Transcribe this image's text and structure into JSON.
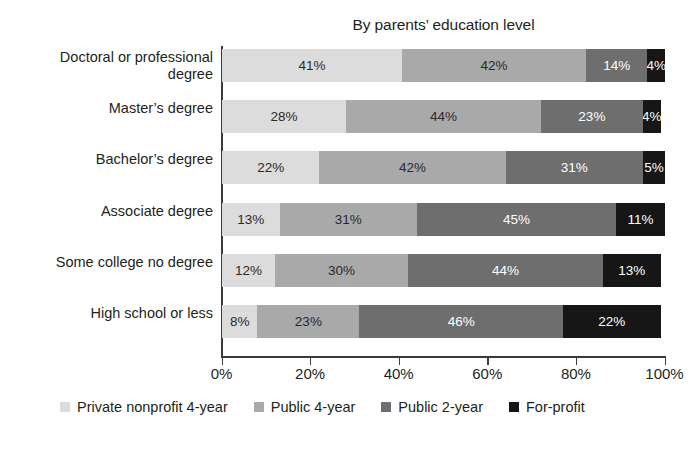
{
  "chart_data": {
    "type": "bar",
    "subtype": "stacked-horizontal-100pct",
    "title": "By parents’ education level",
    "xlabel": "",
    "ylabel": "",
    "xlim": [
      0,
      100
    ],
    "grid": false,
    "legend_position": "bottom",
    "categories": [
      "Doctoral or professional\ndegree",
      "Master’s degree",
      "Bachelor’s degree",
      "Associate degree",
      "Some college no degree",
      "High school or less"
    ],
    "series": [
      {
        "name": "Private nonprofit 4-year",
        "color": "#dcdcdc",
        "values": [
          41,
          28,
          22,
          13,
          12,
          8
        ]
      },
      {
        "name": "Public 4-year",
        "color": "#a9a9a9",
        "values": [
          42,
          44,
          42,
          31,
          30,
          23
        ]
      },
      {
        "name": "Public 2-year",
        "color": "#6e6e6e",
        "values": [
          14,
          23,
          31,
          45,
          44,
          46
        ]
      },
      {
        "name": "For-profit",
        "color": "#161616",
        "values": [
          4,
          4,
          5,
          11,
          13,
          22
        ]
      }
    ],
    "data_labels": [
      [
        "41%",
        "42%",
        "14%",
        "4%"
      ],
      [
        "28%",
        "44%",
        "23%",
        "4%"
      ],
      [
        "22%",
        "42%",
        "31%",
        "5%"
      ],
      [
        "13%",
        "31%",
        "45%",
        "11%"
      ],
      [
        "12%",
        "30%",
        "44%",
        "13%"
      ],
      [
        "8%",
        "23%",
        "46%",
        "22%"
      ]
    ],
    "xticks": [
      0,
      20,
      40,
      60,
      80,
      100
    ],
    "xtick_labels": [
      "0%",
      "20%",
      "40%",
      "60%",
      "80%",
      "100%"
    ]
  },
  "legend": {
    "items": [
      {
        "label": "Private nonprofit 4-year",
        "color": "#dcdcdc"
      },
      {
        "label": "Public 4-year",
        "color": "#a9a9a9"
      },
      {
        "label": "Public 2-year",
        "color": "#6e6e6e"
      },
      {
        "label": "For-profit",
        "color": "#161616"
      }
    ]
  },
  "axis": {
    "line_color": "#3b3b3b"
  }
}
